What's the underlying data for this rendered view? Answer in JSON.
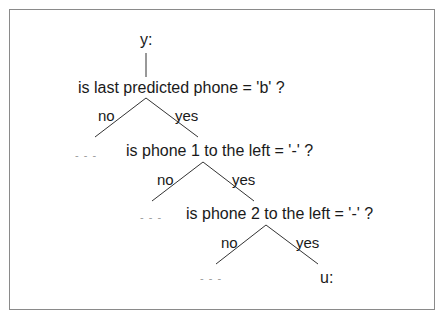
{
  "tree": {
    "root_label": "y:",
    "nodes": [
      {
        "question": "is last predicted phone = 'b' ?",
        "no_label": "no",
        "yes_label": "yes",
        "no_branch": "- - -"
      },
      {
        "question": "is phone 1 to the left = '-' ?",
        "no_label": "no",
        "yes_label": "yes",
        "no_branch": "- - -"
      },
      {
        "question": "is phone 2 to the left = '-' ?",
        "no_label": "no",
        "yes_label": "yes",
        "no_branch": "- - -"
      }
    ],
    "leaf_label": "u:"
  }
}
